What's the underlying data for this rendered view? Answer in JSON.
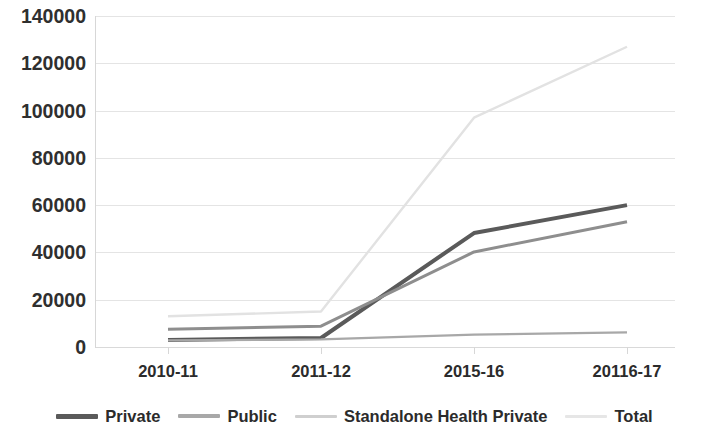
{
  "chart_data": {
    "type": "line",
    "title": "",
    "xlabel": "",
    "ylabel": "",
    "categories": [
      "2010-11",
      "2011-12",
      "2015-16",
      "20116-17"
    ],
    "ylim": [
      0,
      140000
    ],
    "ytick_labels": [
      "0",
      "20000",
      "40000",
      "60000",
      "80000",
      "100000",
      "120000",
      "140000"
    ],
    "ytick_values": [
      0,
      20000,
      40000,
      60000,
      80000,
      100000,
      120000,
      140000
    ],
    "grid": true,
    "legend_position": "bottom",
    "series": [
      {
        "name": "Private",
        "values": [
          3000,
          3800,
          48200,
          60000
        ],
        "color": "#5a5a5a",
        "width": 4.0
      },
      {
        "name": "Public",
        "values": [
          2800,
          3200,
          5200,
          6200
        ],
        "color": "#a8a8a8",
        "width": 2.2
      },
      {
        "name": "Standalone Health Private",
        "values": [
          7500,
          8800,
          40200,
          53000
        ],
        "color": "#8e8e8e",
        "width": 3.0
      },
      {
        "name": "Total",
        "values": [
          13000,
          15000,
          97000,
          127000
        ],
        "color": "#e2e2e2",
        "width": 2.4
      }
    ]
  },
  "legend": {
    "items": [
      {
        "label": "Private",
        "color": "#5a5a5a",
        "thickness": "5px"
      },
      {
        "label": "Public",
        "color": "#a8a8a8",
        "thickness": "4px"
      },
      {
        "label": "Standalone Health Private",
        "color": "#cfcfcf",
        "thickness": "3px"
      },
      {
        "label": "Total",
        "color": "#e6e6e6",
        "thickness": "3px"
      }
    ]
  },
  "axis_colors": {
    "grid": "#e4e4e4",
    "axis": "#d7d7d7",
    "tick_text": "#2f2f2f"
  }
}
